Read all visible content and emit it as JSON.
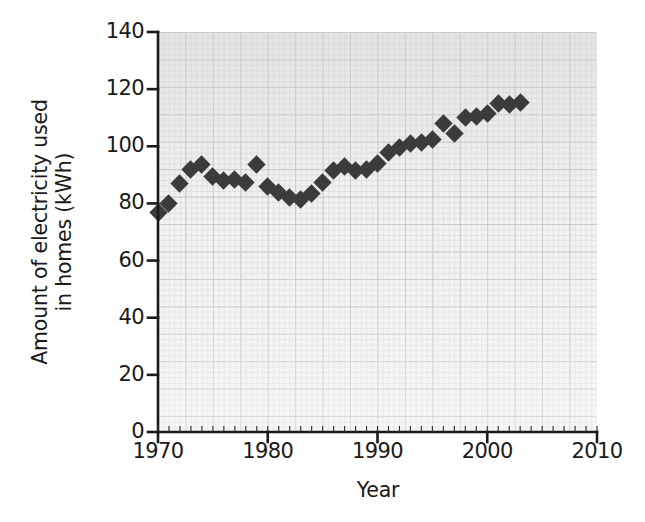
{
  "chart_data": {
    "type": "scatter",
    "title": "",
    "xlabel": "Year",
    "ylabel": "Amount of electricity used in homes (kWh)",
    "ylabel_lines": [
      "Amount of electricity used",
      "in homes (kWh)"
    ],
    "xlim": [
      1970,
      2010
    ],
    "ylim": [
      0,
      140
    ],
    "xticks": [
      1970,
      1980,
      1990,
      2000,
      2010
    ],
    "yticks": [
      0,
      20,
      40,
      60,
      80,
      100,
      120,
      140
    ],
    "xtick_labels": [
      "1970",
      "1980",
      "1990",
      "2000",
      "2010"
    ],
    "ytick_labels": [
      "0",
      "20",
      "40",
      "60",
      "80",
      "100",
      "120",
      "140"
    ],
    "grid": true,
    "grid_major_step_x": 2.5,
    "grid_major_step_y": 10,
    "grid_minor_step_x": 0.5,
    "grid_minor_step_y": 2,
    "legend": "none",
    "marker": "diamond",
    "marker_color": "#3b3b3b",
    "plot_background": "#f2f2f2",
    "x": [
      1970,
      1971,
      1972,
      1973,
      1974,
      1975,
      1976,
      1977,
      1978,
      1979,
      1980,
      1981,
      1982,
      1983,
      1984,
      1985,
      1986,
      1987,
      1988,
      1989,
      1990,
      1991,
      1992,
      1993,
      1994,
      1995,
      1996,
      1997,
      1998,
      1999,
      2000,
      2001,
      2002,
      2003
    ],
    "values": [
      77,
      80,
      87,
      92,
      93.5,
      89.5,
      88,
      88.5,
      87.5,
      93.5,
      86,
      84,
      82,
      81.5,
      83.5,
      87.5,
      91.5,
      93,
      91.5,
      92,
      94,
      98,
      99.5,
      101,
      101.5,
      102.5,
      108,
      104.5,
      110,
      110.5,
      111.5,
      115,
      114.5,
      115.5
    ],
    "points": [
      {
        "year": 1970,
        "value": 77
      },
      {
        "year": 1971,
        "value": 80
      },
      {
        "year": 1972,
        "value": 87
      },
      {
        "year": 1973,
        "value": 92
      },
      {
        "year": 1974,
        "value": 93.5
      },
      {
        "year": 1975,
        "value": 89.5
      },
      {
        "year": 1976,
        "value": 88
      },
      {
        "year": 1977,
        "value": 88.5
      },
      {
        "year": 1978,
        "value": 87.5
      },
      {
        "year": 1979,
        "value": 93.5
      },
      {
        "year": 1980,
        "value": 86
      },
      {
        "year": 1981,
        "value": 84
      },
      {
        "year": 1982,
        "value": 82
      },
      {
        "year": 1983,
        "value": 81.5
      },
      {
        "year": 1984,
        "value": 83.5
      },
      {
        "year": 1985,
        "value": 87.5
      },
      {
        "year": 1986,
        "value": 91.5
      },
      {
        "year": 1987,
        "value": 93
      },
      {
        "year": 1988,
        "value": 91.5
      },
      {
        "year": 1989,
        "value": 92
      },
      {
        "year": 1990,
        "value": 94
      },
      {
        "year": 1991,
        "value": 98
      },
      {
        "year": 1992,
        "value": 99.5
      },
      {
        "year": 1993,
        "value": 101
      },
      {
        "year": 1994,
        "value": 101.5
      },
      {
        "year": 1995,
        "value": 102.5
      },
      {
        "year": 1996,
        "value": 108
      },
      {
        "year": 1997,
        "value": 104.5
      },
      {
        "year": 1998,
        "value": 110
      },
      {
        "year": 1999,
        "value": 110.5
      },
      {
        "year": 2000,
        "value": 111.5
      },
      {
        "year": 2001,
        "value": 115
      },
      {
        "year": 2002,
        "value": 114.5
      },
      {
        "year": 2003,
        "value": 115.5
      }
    ]
  },
  "axes": {
    "x_title": "Year",
    "y_title_line1": "Amount of electricity used",
    "y_title_line2": "in homes (kWh)"
  }
}
